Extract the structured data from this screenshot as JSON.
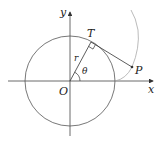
{
  "diagram": {
    "labels": {
      "x_axis": "x",
      "y_axis": "y",
      "origin": "O",
      "tangent_point": "T",
      "point": "P",
      "radius": "r",
      "angle": "θ"
    },
    "colors": {
      "axis": "#333333",
      "circle": "#555555",
      "involute": "#aaaaaa",
      "segment": "#333333"
    }
  }
}
